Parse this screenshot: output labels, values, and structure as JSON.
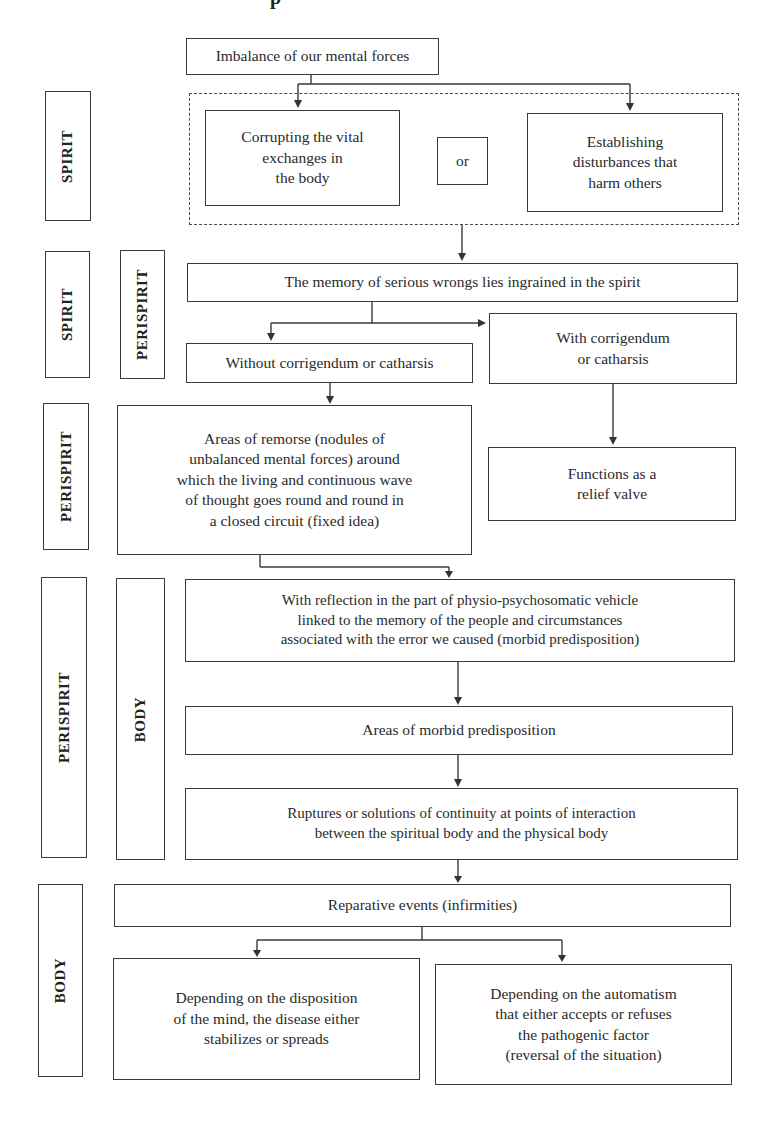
{
  "header": {
    "title_fragment": "p"
  },
  "side_labels": {
    "spirit_1": "SPIRIT",
    "spirit_2": "SPIRIT",
    "perispirit_1": "PERISPIRIT",
    "perispirit_2": "PERISPIRIT",
    "perispirit_3": "PERISPIRIT",
    "body_1": "BODY",
    "body_2": "BODY"
  },
  "nodes": {
    "imbalance": "Imbalance of our mental forces",
    "corrupting": [
      "Corrupting the vital",
      "exchanges in",
      "the body"
    ],
    "or": "or",
    "establishing": [
      "Establishing",
      "disturbances that",
      "harm others"
    ],
    "memory": "The memory of serious wrongs lies ingrained in the spirit",
    "without": "Without corrigendum or catharsis",
    "with": [
      "With corrigendum",
      "or catharsis"
    ],
    "remorse": [
      "Areas of remorse (nodules of",
      "unbalanced mental forces) around",
      "which the living and continuous wave",
      "of thought goes round and round in",
      "a closed circuit (fixed idea)"
    ],
    "relief": [
      "Functions as a",
      "relief valve"
    ],
    "reflection": [
      "With reflection in the part of physio-psychosomatic vehicle",
      "linked to the memory of the people and circumstances",
      "associated with the error we caused (morbid predisposition)"
    ],
    "morbid": "Areas of morbid predisposition",
    "ruptures": [
      "Ruptures or solutions of continuity at points of interaction",
      "between the spiritual body and the physical body"
    ],
    "reparative": "Reparative events (infirmities)",
    "disposition": [
      "Depending on the disposition",
      "of the mind, the disease either",
      "stabilizes or spreads"
    ],
    "automatism": [
      "Depending on the automatism",
      "that either accepts or refuses",
      "the pathogenic factor",
      "(reversal of the situation)"
    ]
  },
  "colors": {
    "line": "#3a3a3a",
    "background": "#ffffff"
  }
}
